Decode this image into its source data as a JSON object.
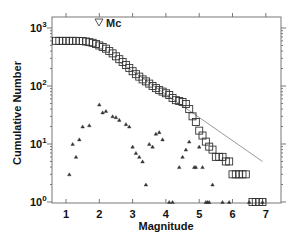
{
  "chart_data": {
    "type": "scatter",
    "title": "",
    "xlabel": "Magnitude",
    "ylabel": "Cumulative Number",
    "xlim": [
      0.6,
      7.5
    ],
    "ylim": [
      1,
      1000
    ],
    "yscale": "log",
    "xticks": [
      "1",
      "2",
      "3",
      "4",
      "5",
      "6",
      "7"
    ],
    "yticks": [
      "10^0",
      "10^1",
      "10^2",
      "10^3"
    ],
    "grid": false,
    "legend": [
      {
        "marker": "inverted-triangle",
        "label": "Mc"
      }
    ],
    "series": [
      {
        "name": "Cumulative number",
        "marker": "square",
        "x": [
          0.7,
          0.8,
          0.9,
          1.0,
          1.1,
          1.2,
          1.3,
          1.4,
          1.5,
          1.6,
          1.7,
          1.8,
          1.9,
          2.0,
          2.1,
          2.2,
          2.3,
          2.4,
          2.5,
          2.6,
          2.7,
          2.8,
          2.9,
          3.0,
          3.1,
          3.2,
          3.3,
          3.4,
          3.5,
          3.6,
          3.7,
          3.8,
          3.9,
          4.0,
          4.1,
          4.2,
          4.3,
          4.4,
          4.5,
          4.6,
          4.7,
          4.8,
          4.9,
          5.0,
          5.1,
          5.2,
          5.3,
          5.4,
          5.5,
          5.6,
          5.7,
          5.8,
          5.9,
          6.0,
          6.1,
          6.2,
          6.3,
          6.4,
          6.6,
          6.7,
          6.8,
          6.9
        ],
        "y": [
          600,
          600,
          600,
          600,
          600,
          600,
          600,
          598,
          595,
          585,
          570,
          555,
          530,
          500,
          470,
          440,
          400,
          365,
          325,
          290,
          260,
          230,
          205,
          180,
          160,
          145,
          130,
          120,
          110,
          100,
          92,
          85,
          80,
          75,
          70,
          62,
          57,
          55,
          53,
          49,
          40,
          30,
          24,
          17,
          14,
          11,
          9,
          8,
          6,
          6,
          6,
          5,
          5,
          3,
          3,
          3,
          3,
          3,
          1,
          1,
          1,
          1
        ]
      },
      {
        "name": "Non-cumulative number",
        "marker": "triangle",
        "x": [
          1.1,
          1.2,
          1.3,
          1.4,
          1.5,
          1.7,
          2.0,
          2.1,
          2.2,
          2.4,
          2.5,
          2.6,
          2.8,
          2.9,
          3.0,
          3.1,
          3.2,
          3.3,
          3.4,
          3.5,
          3.6,
          3.7,
          3.8,
          3.9,
          4.1,
          4.2,
          4.4,
          4.5,
          4.6,
          4.7,
          4.85,
          4.9,
          5.0,
          5.1,
          5.2,
          5.25,
          5.3,
          5.4,
          5.7,
          5.9,
          6.5,
          6.9
        ],
        "y": [
          3,
          10,
          6,
          12,
          20,
          21,
          48,
          35,
          37,
          30,
          29,
          26,
          22,
          20,
          9,
          7,
          6,
          5,
          2,
          10,
          9,
          15,
          16,
          12,
          1,
          1,
          4,
          6,
          8,
          11,
          4,
          4,
          9,
          4,
          1,
          1,
          1,
          2,
          1,
          1,
          1,
          1
        ]
      },
      {
        "name": "Gutenberg-Richter fit",
        "type": "line",
        "x": [
          2.6,
          6.9
        ],
        "y": [
          260,
          5
        ]
      }
    ],
    "annotations": [
      {
        "text": "Mc",
        "marker": "inverted-triangle",
        "x": 2.05,
        "y": 1000
      }
    ]
  },
  "labels": {
    "xlabel": "Magnitude",
    "ylabel": "Cumulative Number",
    "legend_mc": "Mc",
    "xticks": [
      "1",
      "2",
      "3",
      "4",
      "5",
      "6",
      "7"
    ],
    "ytick_base": "10",
    "ytick_exps": [
      "0",
      "1",
      "2",
      "3"
    ]
  }
}
